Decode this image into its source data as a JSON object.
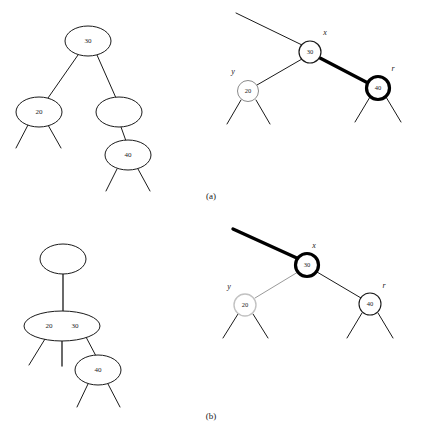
{
  "figure": {
    "width": 424,
    "height": 442,
    "background": "#ffffff",
    "ink": "#1a1a1a",
    "faded_ink": "#b0b0b0",
    "highlight": "#000000"
  },
  "captions": [
    {
      "id": "caption-a",
      "text": "(a)",
      "x": 211,
      "y": 197,
      "font_size": 9
    },
    {
      "id": "caption-b",
      "text": "(b)",
      "x": 211,
      "y": 417,
      "font_size": 9
    }
  ],
  "panels": [
    {
      "id": "panel-top-left",
      "name": "btree-before",
      "kind": "btree",
      "ellipses": [
        {
          "id": "tl-root",
          "label": "30",
          "cx": 88,
          "cy": 41,
          "rx": 23,
          "ry": 15,
          "stroke": "#1a1a1a",
          "stroke_width": 1,
          "font_size": 7,
          "labels": [
            {
              "text": "30",
              "dx": 0
            }
          ]
        },
        {
          "id": "tl-left",
          "label": "20",
          "cx": 39,
          "cy": 112,
          "rx": 23,
          "ry": 15,
          "stroke": "#1a1a1a",
          "stroke_width": 1,
          "font_size": 7,
          "labels": [
            {
              "text": "20",
              "dx": 0
            }
          ]
        },
        {
          "id": "tl-right-empty",
          "label": "",
          "cx": 119,
          "cy": 112,
          "rx": 23,
          "ry": 15,
          "stroke": "#1a1a1a",
          "stroke_width": 1,
          "font_size": 7,
          "labels": []
        },
        {
          "id": "tl-child-40",
          "label": "40",
          "cx": 128,
          "cy": 155,
          "rx": 23,
          "ry": 15,
          "stroke": "#1a1a1a",
          "stroke_width": 1,
          "font_size": 7,
          "labels": [
            {
              "text": "40",
              "dx": 0
            }
          ]
        }
      ],
      "edges": [
        {
          "id": "tl-e1",
          "x1": 78,
          "y1": 55,
          "x2": 48,
          "y2": 98,
          "stroke": "#1a1a1a",
          "stroke_width": 1
        },
        {
          "id": "tl-e2",
          "x1": 97,
          "y1": 55,
          "x2": 116,
          "y2": 98,
          "stroke": "#1a1a1a",
          "stroke_width": 1
        },
        {
          "id": "tl-e3",
          "x1": 121,
          "y1": 127,
          "x2": 126,
          "y2": 141,
          "stroke": "#1a1a1a",
          "stroke_width": 1
        },
        {
          "id": "tl-s1",
          "x1": 28,
          "y1": 125,
          "x2": 16,
          "y2": 148,
          "stroke": "#1a1a1a",
          "stroke_width": 1
        },
        {
          "id": "tl-s2",
          "x1": 48,
          "y1": 125,
          "x2": 61,
          "y2": 148,
          "stroke": "#1a1a1a",
          "stroke_width": 1
        },
        {
          "id": "tl-s3",
          "x1": 117,
          "y1": 169,
          "x2": 106,
          "y2": 191,
          "stroke": "#1a1a1a",
          "stroke_width": 1
        },
        {
          "id": "tl-s4",
          "x1": 138,
          "y1": 169,
          "x2": 150,
          "y2": 191,
          "stroke": "#1a1a1a",
          "stroke_width": 1
        }
      ],
      "vars": []
    },
    {
      "id": "panel-top-right",
      "name": "rbtree-before",
      "kind": "rbtree",
      "circles": [
        {
          "id": "tr-x",
          "label": "30",
          "cx": 310,
          "cy": 52,
          "r": 11,
          "stroke": "#1a1a1a",
          "stroke_width": 1.2,
          "font_size": 6.5,
          "text_fill": "#1a1a1a"
        },
        {
          "id": "tr-y",
          "label": "20",
          "cx": 248,
          "cy": 91,
          "r": 10.5,
          "stroke": "#8a8a8a",
          "stroke_width": 1,
          "font_size": 6.5,
          "text_fill": "#6a6a6a"
        },
        {
          "id": "tr-r",
          "label": "40",
          "cx": 378,
          "cy": 88,
          "r": 11.5,
          "stroke": "#000000",
          "stroke_width": 3.2,
          "font_size": 6.5,
          "text_fill": "#1a1a1a"
        }
      ],
      "edges": [
        {
          "id": "tr-parent",
          "x1": 236,
          "y1": 13,
          "x2": 302,
          "y2": 45,
          "stroke": "#1a1a1a",
          "stroke_width": 1
        },
        {
          "id": "tr-x-y",
          "x1": 302,
          "y1": 59,
          "x2": 257,
          "y2": 85,
          "stroke": "#1a1a1a",
          "stroke_width": 1
        },
        {
          "id": "tr-x-r",
          "x1": 320,
          "y1": 58,
          "x2": 368,
          "y2": 83,
          "stroke": "#000000",
          "stroke_width": 3.2
        },
        {
          "id": "tr-y-l1",
          "x1": 241,
          "y1": 100,
          "x2": 227,
          "y2": 124,
          "stroke": "#1a1a1a",
          "stroke_width": 1
        },
        {
          "id": "tr-y-l2",
          "x1": 256,
          "y1": 100,
          "x2": 270,
          "y2": 124,
          "stroke": "#1a1a1a",
          "stroke_width": 1
        },
        {
          "id": "tr-r-l1",
          "x1": 370,
          "y1": 97,
          "x2": 355,
          "y2": 122,
          "stroke": "#1a1a1a",
          "stroke_width": 1
        },
        {
          "id": "tr-r-l2",
          "x1": 386,
          "y1": 97,
          "x2": 401,
          "y2": 122,
          "stroke": "#1a1a1a",
          "stroke_width": 1
        }
      ],
      "vars": [
        {
          "id": "tr-label-x",
          "text": "x",
          "x": 325,
          "y": 33,
          "font_size": 8,
          "fill": "#1a1a1a"
        },
        {
          "id": "tr-label-y",
          "text": "y",
          "x": 233,
          "y": 72,
          "font_size": 8,
          "fill": "#1a1a1a"
        },
        {
          "id": "tr-label-r",
          "text": "r",
          "x": 393,
          "y": 69,
          "font_size": 8,
          "fill": "#1a1a1a"
        }
      ]
    },
    {
      "id": "panel-bottom-left",
      "name": "btree-after",
      "kind": "btree",
      "ellipses": [
        {
          "id": "bl-root-empty",
          "label": "",
          "cx": 63,
          "cy": 259,
          "rx": 23,
          "ry": 15,
          "stroke": "#1a1a1a",
          "stroke_width": 1,
          "font_size": 7,
          "labels": []
        },
        {
          "id": "bl-node-2030",
          "label": "20 30",
          "cx": 62,
          "cy": 326,
          "rx": 38,
          "ry": 15,
          "stroke": "#1a1a1a",
          "stroke_width": 1,
          "font_size": 7,
          "labels": [
            {
              "text": "20",
              "dx": -13
            },
            {
              "text": "30",
              "dx": 13
            }
          ]
        },
        {
          "id": "bl-node-40",
          "label": "40",
          "cx": 98,
          "cy": 370,
          "rx": 23,
          "ry": 15,
          "stroke": "#1a1a1a",
          "stroke_width": 1,
          "font_size": 7,
          "labels": [
            {
              "text": "40",
              "dx": 0
            }
          ]
        }
      ],
      "edges": [
        {
          "id": "bl-e1",
          "x1": 63,
          "y1": 273,
          "x2": 63,
          "y2": 311,
          "stroke": "#1a1a1a",
          "stroke_width": 1.3
        },
        {
          "id": "bl-e2",
          "x1": 86,
          "y1": 337,
          "x2": 96,
          "y2": 356,
          "stroke": "#1a1a1a",
          "stroke_width": 1
        },
        {
          "id": "bl-s1",
          "x1": 45,
          "y1": 339,
          "x2": 29,
          "y2": 365,
          "stroke": "#1a1a1a",
          "stroke_width": 1
        },
        {
          "id": "bl-s2",
          "x1": 62,
          "y1": 340,
          "x2": 62,
          "y2": 366,
          "stroke": "#1a1a1a",
          "stroke_width": 1.3
        },
        {
          "id": "bl-s3",
          "x1": 88,
          "y1": 384,
          "x2": 77,
          "y2": 407,
          "stroke": "#1a1a1a",
          "stroke_width": 1
        },
        {
          "id": "bl-s4",
          "x1": 108,
          "y1": 384,
          "x2": 120,
          "y2": 407,
          "stroke": "#1a1a1a",
          "stroke_width": 1
        }
      ],
      "vars": []
    },
    {
      "id": "panel-bottom-right",
      "name": "rbtree-after",
      "kind": "rbtree",
      "circles": [
        {
          "id": "br-x",
          "label": "30",
          "cx": 307,
          "cy": 265,
          "r": 11.5,
          "stroke": "#000000",
          "stroke_width": 3.2,
          "font_size": 6.5,
          "text_fill": "#1a1a1a"
        },
        {
          "id": "br-y",
          "label": "20",
          "cx": 245,
          "cy": 305,
          "r": 11,
          "stroke": "#c2c2c2",
          "stroke_width": 1.4,
          "font_size": 6.5,
          "text_fill": "#a8a8a8"
        },
        {
          "id": "br-r",
          "label": "40",
          "cx": 370,
          "cy": 304,
          "r": 11,
          "stroke": "#1a1a1a",
          "stroke_width": 1.1,
          "font_size": 6.5,
          "text_fill": "#1a1a1a"
        }
      ],
      "edges": [
        {
          "id": "br-parent",
          "x1": 233,
          "y1": 229,
          "x2": 299,
          "y2": 259,
          "stroke": "#000000",
          "stroke_width": 3.4
        },
        {
          "id": "br-x-y",
          "x1": 298,
          "y1": 272,
          "x2": 255,
          "y2": 298,
          "stroke": "#9a9a9a",
          "stroke_width": 1
        },
        {
          "id": "br-x-r",
          "x1": 317,
          "y1": 272,
          "x2": 361,
          "y2": 298,
          "stroke": "#1a1a1a",
          "stroke_width": 1
        },
        {
          "id": "br-y-l1",
          "x1": 238,
          "y1": 314,
          "x2": 223,
          "y2": 338,
          "stroke": "#1a1a1a",
          "stroke_width": 1
        },
        {
          "id": "br-y-l2",
          "x1": 253,
          "y1": 314,
          "x2": 268,
          "y2": 338,
          "stroke": "#1a1a1a",
          "stroke_width": 1
        },
        {
          "id": "br-r-l1",
          "x1": 362,
          "y1": 313,
          "x2": 347,
          "y2": 338,
          "stroke": "#1a1a1a",
          "stroke_width": 1
        },
        {
          "id": "br-r-l2",
          "x1": 378,
          "y1": 313,
          "x2": 393,
          "y2": 338,
          "stroke": "#1a1a1a",
          "stroke_width": 1
        }
      ],
      "vars": [
        {
          "id": "br-label-x",
          "text": "x",
          "x": 314,
          "y": 246,
          "font_size": 8,
          "fill": "#1a1a1a"
        },
        {
          "id": "br-label-y",
          "text": "y",
          "x": 229,
          "y": 287,
          "font_size": 8,
          "fill": "#8a8a8a"
        },
        {
          "id": "br-label-r",
          "text": "r",
          "x": 384,
          "y": 286,
          "font_size": 8,
          "fill": "#1a1a1a"
        }
      ]
    }
  ]
}
